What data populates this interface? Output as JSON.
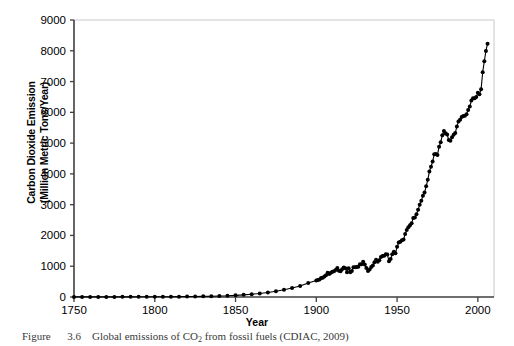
{
  "figure": {
    "caption_prefix": "Figure",
    "caption_number": "3.6",
    "caption_text_before_sub": "Global emissions of CO",
    "caption_sub": "2",
    "caption_text_after_sub": " from fossil fuels (CDIAC, 2009)"
  },
  "axes": {
    "x_title": "Year",
    "y_title": "Carbon Dioxide Emission\n(Million Metric Tons/Year)"
  },
  "colors": {
    "line": "#000000",
    "marker": "#000000",
    "axis": "#3f3f3f",
    "frame": "#c8c8c8",
    "background": "#ffffff",
    "caption": "#3a3a3a"
  },
  "chart_data": {
    "type": "line",
    "title": "",
    "xlabel": "Year",
    "ylabel": "Carbon Dioxide Emission (Million Metric Tons/Year)",
    "xlim": [
      1750,
      2010
    ],
    "ylim": [
      0,
      9000
    ],
    "xticks": [
      1750,
      1800,
      1850,
      1900,
      1950,
      2000
    ],
    "xtick_labels": [
      "1750",
      "1800",
      "1850",
      "1900",
      "1950",
      "2000"
    ],
    "yticks": [
      0,
      1000,
      2000,
      3000,
      4000,
      5000,
      6000,
      7000,
      8000,
      9000
    ],
    "ytick_labels": [
      "0",
      "1000",
      "2000",
      "3000",
      "4000",
      "5000",
      "6000",
      "7000",
      "8000",
      "9000"
    ],
    "grid": false,
    "legend": null,
    "marker": "filled-circle",
    "series": [
      {
        "name": "Global CO2 emissions from fossil fuels",
        "units": "Million Metric Tons per Year",
        "x": [
          1750,
          1755,
          1760,
          1765,
          1770,
          1775,
          1780,
          1785,
          1790,
          1795,
          1800,
          1805,
          1810,
          1815,
          1820,
          1825,
          1830,
          1835,
          1840,
          1845,
          1850,
          1855,
          1860,
          1865,
          1870,
          1875,
          1880,
          1885,
          1890,
          1895,
          1900,
          1901,
          1902,
          1903,
          1904,
          1905,
          1906,
          1907,
          1908,
          1909,
          1910,
          1911,
          1912,
          1913,
          1914,
          1915,
          1916,
          1917,
          1918,
          1919,
          1920,
          1921,
          1922,
          1923,
          1924,
          1925,
          1926,
          1927,
          1928,
          1929,
          1930,
          1931,
          1932,
          1933,
          1934,
          1935,
          1936,
          1937,
          1938,
          1939,
          1940,
          1941,
          1942,
          1943,
          1944,
          1945,
          1946,
          1947,
          1948,
          1949,
          1950,
          1951,
          1952,
          1953,
          1954,
          1955,
          1956,
          1957,
          1958,
          1959,
          1960,
          1961,
          1962,
          1963,
          1964,
          1965,
          1966,
          1967,
          1968,
          1969,
          1970,
          1971,
          1972,
          1973,
          1974,
          1975,
          1976,
          1977,
          1978,
          1979,
          1980,
          1981,
          1982,
          1983,
          1984,
          1985,
          1986,
          1987,
          1988,
          1989,
          1990,
          1991,
          1992,
          1993,
          1994,
          1995,
          1996,
          1997,
          1998,
          1999,
          2000,
          2001,
          2002,
          2003,
          2004,
          2005,
          2006
        ],
        "y": [
          3,
          3,
          3,
          4,
          4,
          4,
          5,
          5,
          6,
          6,
          8,
          9,
          10,
          12,
          14,
          17,
          21,
          26,
          32,
          40,
          54,
          70,
          91,
          116,
          147,
          188,
          236,
          290,
          357,
          452,
          534,
          552,
          566,
          617,
          624,
          663,
          710,
          784,
          750,
          785,
          819,
          836,
          879,
          943,
          850,
          838,
          901,
          955,
          936,
          806,
          932,
          803,
          845,
          970,
          963,
          975,
          983,
          1062,
          1065,
          1145,
          1053,
          940,
          847,
          893,
          973,
          1027,
          1130,
          1209,
          1142,
          1192,
          1299,
          1334,
          1342,
          1391,
          1383,
          1160,
          1238,
          1392,
          1469,
          1419,
          1630,
          1768,
          1796,
          1841,
          1865,
          2043,
          2177,
          2270,
          2330,
          2395,
          2569,
          2580,
          2686,
          2833,
          2995,
          3130,
          3288,
          3393,
          3596,
          3809,
          4076,
          4231,
          4399,
          4635,
          4644,
          4615,
          4883,
          5029,
          5254,
          5395,
          5324,
          5280,
          5103,
          5078,
          5188,
          5268,
          5326,
          5538,
          5705,
          5755,
          5850,
          5883,
          5885,
          5940,
          6078,
          6188,
          6383,
          6458,
          6458,
          6500,
          6640,
          6590,
          6746,
          7304,
          7661,
          7995,
          8230
        ]
      }
    ],
    "annotations": []
  }
}
